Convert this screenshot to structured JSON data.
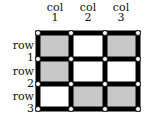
{
  "columns": [
    {
      "label_line1": "col",
      "label_line2": "1"
    },
    {
      "label_line1": "col",
      "label_line2": "2"
    },
    {
      "label_line1": "col",
      "label_line2": "3"
    }
  ],
  "rows": [
    {
      "label": "row 1"
    },
    {
      "label": "row 2"
    },
    {
      "label": "row 3"
    }
  ],
  "cells": [
    [
      "gray",
      "white",
      "gray"
    ],
    [
      "gray",
      "white",
      "white"
    ],
    [
      "white",
      "gray",
      "gray"
    ]
  ],
  "colors": {
    "grid_line": "#000000",
    "shaded": "#c8c8c8",
    "unshaded": "#ffffff",
    "node_fill": "#ffffff",
    "node_stroke": "#000000"
  }
}
